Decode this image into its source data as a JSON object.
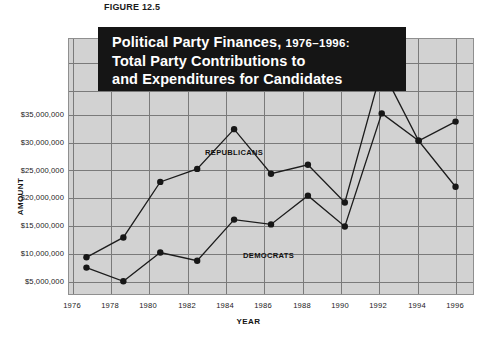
{
  "figure": {
    "number_label": "FIGURE 12.5"
  },
  "title": {
    "line1_main": "Political Party Finances,",
    "line1_years": "1976–1996:",
    "line2": "Total Party Contributions to",
    "line3": "and Expenditures for Candidates"
  },
  "axes": {
    "y_title": "AMOUNT",
    "x_title": "YEAR",
    "y_ticks": [
      "$35,000,000",
      "$30,000,000",
      "$25,000,000",
      "$20,000,000",
      "$15,000,000",
      "$10,000,000",
      "$5,000,000"
    ],
    "x_ticks": [
      "1976",
      "1978",
      "1980",
      "1982",
      "1984",
      "1986",
      "1988",
      "1990",
      "1992",
      "1994",
      "1996"
    ]
  },
  "series_labels": {
    "republicans": "REPUBLICANS",
    "democrats": "DEMOCRATS"
  },
  "colors": {
    "panel_background": "#d2d2d2",
    "gridline": "#7a7a7a",
    "line": "#1c1c1c",
    "marker": "#171717",
    "banner_background": "#151515",
    "banner_text": "#ffffff",
    "page_background": "#ffffff"
  },
  "chart_data": {
    "type": "line",
    "title": "Political Party Finances, 1976–1996: Total Party Contributions to and Expenditures for Candidates",
    "xlabel": "YEAR",
    "ylabel": "AMOUNT",
    "x": [
      1976,
      1978,
      1980,
      1982,
      1984,
      1986,
      1988,
      1990,
      1992,
      1994,
      1996
    ],
    "xlim": [
      1975,
      1997
    ],
    "ylim": [
      0,
      37500000
    ],
    "ytick_values": [
      5000000,
      10000000,
      15000000,
      20000000,
      25000000,
      30000000,
      35000000
    ],
    "grid": true,
    "legend_position": "inline-annotations",
    "series": [
      {
        "name": "REPUBLICANS",
        "values": [
          5500000,
          8400000,
          16500000,
          18400000,
          24200000,
          17700000,
          19000000,
          13500000,
          33000000,
          22500000,
          25300000
        ]
      },
      {
        "name": "DEMOCRATS",
        "values": [
          4000000,
          2000000,
          6200000,
          5000000,
          11000000,
          10300000,
          14500000,
          10000000,
          26500000,
          22500000,
          15800000
        ]
      }
    ]
  }
}
